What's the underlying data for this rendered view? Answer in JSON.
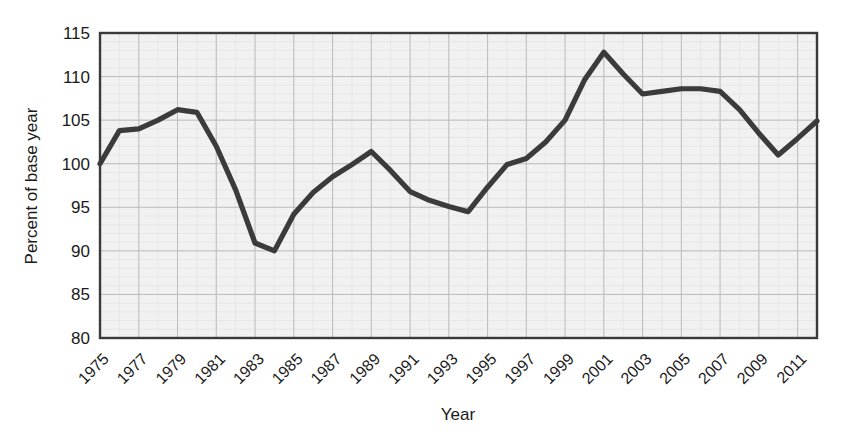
{
  "chart_data": {
    "type": "line",
    "title": "",
    "xlabel": "Year",
    "ylabel": "Percent of base year",
    "xlim": [
      1975,
      2012
    ],
    "ylim": [
      80,
      115
    ],
    "grid": true,
    "legend": "none",
    "y_ticks": [
      80,
      85,
      90,
      95,
      100,
      105,
      110,
      115
    ],
    "x_ticks": [
      1975,
      1977,
      1979,
      1981,
      1983,
      1985,
      1987,
      1989,
      1991,
      1993,
      1995,
      1997,
      1999,
      2001,
      2003,
      2005,
      2007,
      2009,
      2011
    ],
    "x_tick_labels": [
      "1975",
      "1977",
      "1979",
      "1981",
      "1983",
      "1985",
      "1987",
      "1989",
      "1991",
      "1993",
      "1995",
      "1997",
      "1999",
      "2001",
      "2003",
      "2005",
      "2007",
      "2009",
      "2011"
    ],
    "y_tick_labels": [
      "80",
      "85",
      "90",
      "95",
      "100",
      "105",
      "110",
      "115"
    ],
    "series": [
      {
        "name": "Percent of base year",
        "color": "#3b3b3b",
        "x": [
          1975,
          1976,
          1977,
          1978,
          1979,
          1980,
          1981,
          1982,
          1983,
          1984,
          1985,
          1986,
          1987,
          1988,
          1989,
          1990,
          1991,
          1992,
          1993,
          1994,
          1995,
          1996,
          1997,
          1998,
          1999,
          2000,
          2001,
          2002,
          2003,
          2004,
          2005,
          2006,
          2007,
          2008,
          2009,
          2010,
          2011,
          2012
        ],
        "values": [
          100.0,
          103.8,
          104.0,
          105.0,
          106.2,
          105.9,
          102.0,
          97.0,
          90.9,
          90.0,
          94.2,
          96.7,
          98.5,
          99.9,
          101.4,
          99.2,
          96.8,
          95.8,
          95.1,
          94.5,
          97.3,
          99.9,
          100.6,
          102.5,
          105.0,
          109.6,
          112.8,
          110.3,
          108.0,
          108.3,
          108.6,
          108.6,
          108.3,
          106.2,
          103.5,
          101.0,
          102.9,
          104.9
        ]
      }
    ]
  },
  "axis": {
    "x_title": "Year",
    "y_title": "Percent of base year"
  }
}
